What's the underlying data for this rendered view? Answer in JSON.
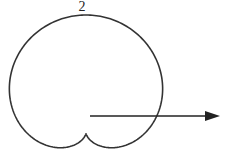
{
  "diagram": {
    "type": "polar-curve",
    "curve": {
      "equation": "r = 1 + sin(theta)",
      "stroke": "#333333",
      "pole": [
        86,
        133
      ],
      "scale": 59
    },
    "top_label": "2",
    "polar_axis": {
      "start": [
        90,
        116
      ],
      "end": [
        220,
        116
      ],
      "color": "#222222"
    }
  }
}
